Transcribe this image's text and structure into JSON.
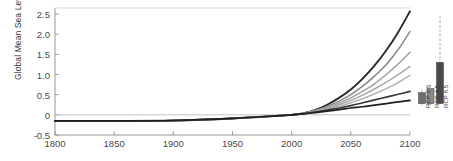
{
  "chart_data": {
    "type": "line",
    "title": "",
    "xlabel": "",
    "ylabel": "Global Mean Sea Level (m)",
    "xlim": [
      1800,
      2100
    ],
    "ylim": [
      -0.5,
      2.6
    ],
    "xticks": [
      1800,
      1850,
      1900,
      1950,
      2000,
      2050,
      2100
    ],
    "yticks": [
      2.5,
      2.0,
      1.5,
      1.0,
      0.5,
      0,
      -0.5
    ],
    "ytick_labels": [
      "2.5",
      "2.0",
      "1.5",
      "1.0",
      "0.5",
      "0",
      "-0.5"
    ],
    "xtick_labels": [
      "1800",
      "1850",
      "1900",
      "1950",
      "2000",
      "2050",
      "2100"
    ],
    "grid": false,
    "legend": "none",
    "zero_line": 0,
    "x": [
      1800,
      1850,
      1900,
      1950,
      1990,
      2000,
      2010,
      2020,
      2030,
      2040,
      2050,
      2060,
      2070,
      2080,
      2090,
      2100
    ],
    "series": [
      {
        "name": "projection-1-highest",
        "color": "#2a2a2a",
        "width": 1.9,
        "values": [
          -0.15,
          -0.15,
          -0.14,
          -0.09,
          -0.02,
          0.0,
          0.04,
          0.12,
          0.25,
          0.42,
          0.63,
          0.9,
          1.22,
          1.6,
          2.05,
          2.57
        ]
      },
      {
        "name": "projection-2",
        "color": "#888888",
        "width": 1.5,
        "values": [
          -0.15,
          -0.15,
          -0.14,
          -0.09,
          -0.02,
          0.0,
          0.04,
          0.11,
          0.21,
          0.34,
          0.5,
          0.71,
          0.96,
          1.25,
          1.62,
          2.07
        ]
      },
      {
        "name": "projection-3",
        "color": "#9e9e9e",
        "width": 1.5,
        "values": [
          -0.15,
          -0.15,
          -0.14,
          -0.09,
          -0.02,
          0.0,
          0.035,
          0.1,
          0.18,
          0.29,
          0.42,
          0.58,
          0.77,
          1.0,
          1.26,
          1.55
        ]
      },
      {
        "name": "projection-4",
        "color": "#a8a8a8",
        "width": 1.5,
        "values": [
          -0.15,
          -0.15,
          -0.14,
          -0.09,
          -0.02,
          0.0,
          0.035,
          0.09,
          0.16,
          0.25,
          0.36,
          0.49,
          0.64,
          0.81,
          1.0,
          1.2
        ]
      },
      {
        "name": "projection-5",
        "color": "#b0b0b0",
        "width": 1.5,
        "values": [
          -0.15,
          -0.15,
          -0.14,
          -0.09,
          -0.02,
          0.0,
          0.03,
          0.08,
          0.14,
          0.21,
          0.3,
          0.4,
          0.52,
          0.65,
          0.8,
          0.98
        ]
      },
      {
        "name": "projection-6",
        "color": "#3a3a3a",
        "width": 1.7,
        "values": [
          -0.15,
          -0.15,
          -0.14,
          -0.09,
          -0.02,
          0.0,
          0.03,
          0.07,
          0.12,
          0.17,
          0.23,
          0.3,
          0.37,
          0.44,
          0.51,
          0.58
        ]
      },
      {
        "name": "projection-7-lowest",
        "color": "#1f1f1f",
        "width": 1.7,
        "values": [
          -0.15,
          -0.15,
          -0.14,
          -0.09,
          -0.02,
          0.0,
          0.025,
          0.055,
          0.09,
          0.13,
          0.17,
          0.2,
          0.24,
          0.28,
          0.32,
          0.36
        ]
      }
    ],
    "scenario_bars": [
      {
        "label": "RCP 2.6",
        "low": 0.28,
        "high": 0.55,
        "whisker_low": 0.24,
        "whisker_high": 0.62,
        "color": "#6e6e6e"
      },
      {
        "label": "RCP 4.5",
        "low": 0.28,
        "high": 0.65,
        "whisker_low": 0.24,
        "whisker_high": 0.74,
        "color": "#8a8a8a"
      },
      {
        "label": "RCP 8.5",
        "low": 0.28,
        "high": 1.3,
        "whisker_low": 0.24,
        "whisker_high": 2.45,
        "color": "#4a4a4a"
      }
    ]
  },
  "axis": {
    "ylabel": "Global Mean Sea Level (m)"
  }
}
